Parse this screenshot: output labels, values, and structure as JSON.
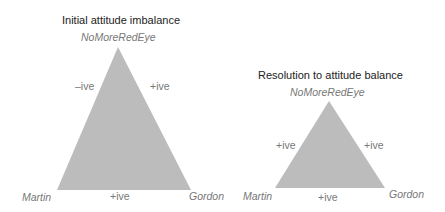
{
  "colors": {
    "triangle_fill": "#bcbcbc",
    "title_text": "#222222",
    "label_text": "#777777",
    "background": "#ffffff"
  },
  "diagrams": [
    {
      "title": "Initial attitude imbalance",
      "nodes": {
        "top": "NoMoreRedEye",
        "left": "Martin",
        "right": "Gordon"
      },
      "edges": {
        "left_top": "–ive",
        "top_right": "+ive",
        "left_right": "+ive"
      }
    },
    {
      "title": "Resolution to attitude balance",
      "nodes": {
        "top": "NoMoreRedEye",
        "left": "Martin",
        "right": "Gordon"
      },
      "edges": {
        "left_top": "+ive",
        "top_right": "+ive",
        "left_right": "+ive"
      }
    }
  ]
}
